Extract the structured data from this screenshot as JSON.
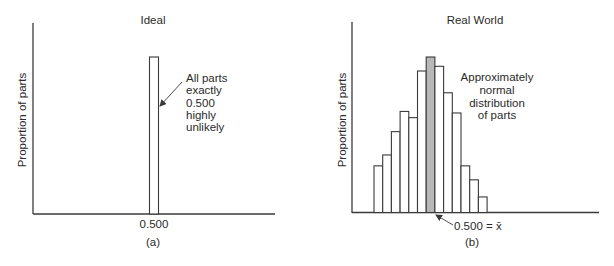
{
  "panels": [
    {
      "id": "a",
      "title": "Ideal",
      "ylabel": "Proportion of parts",
      "xtick": "0.500",
      "caption": "(a)",
      "annotation": [
        "All parts",
        "exactly",
        "0.500",
        "highly",
        "unlikely"
      ]
    },
    {
      "id": "b",
      "title": "Real World",
      "ylabel": "Proportion of parts",
      "xtick": "0.500 = x̄",
      "caption": "(b)",
      "annotation": [
        "Approximately",
        "normal",
        "distribution",
        "of parts"
      ]
    }
  ],
  "colors": {
    "axis": "#3a3a3a",
    "bar_stroke": "#3a3a3a",
    "bar_fill": "#ffffff",
    "highlight_fill": "#b8b8b8"
  },
  "chart_data": [
    {
      "type": "bar",
      "title": "Ideal",
      "xlabel": "",
      "ylabel": "Proportion of parts",
      "categories": [
        "0.500"
      ],
      "values": [
        1.0
      ],
      "annotation": "All parts exactly 0.500 highly unlikely",
      "grid": false
    },
    {
      "type": "bar",
      "title": "Real World",
      "xlabel": "",
      "ylabel": "Proportion of parts",
      "categories": [
        "b1",
        "b2",
        "b3",
        "b4",
        "b5",
        "b6",
        "0.500",
        "b8",
        "b9",
        "b10",
        "b11",
        "b12",
        "b13"
      ],
      "values": [
        0.3,
        0.37,
        0.52,
        0.65,
        0.61,
        0.91,
        1.0,
        0.94,
        0.77,
        0.64,
        0.3,
        0.21,
        0.1
      ],
      "highlight_index": 6,
      "mean_label": "0.500 = x̄",
      "annotation": "Approximately normal distribution of parts",
      "grid": false
    }
  ]
}
